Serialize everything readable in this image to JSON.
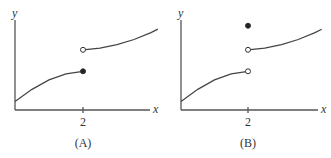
{
  "chart_data": [
    {
      "type": "line",
      "title": "",
      "caption": "(A)",
      "xlabel": "x",
      "ylabel": "y",
      "xticks": [
        {
          "value": 2,
          "label": "2"
        }
      ],
      "xlim": [
        0,
        4.4
      ],
      "ylim": [
        0,
        5
      ],
      "series": [
        {
          "name": "left-piece",
          "points": [
            [
              0,
              0.5
            ],
            [
              0.5,
              1.2
            ],
            [
              1,
              1.75
            ],
            [
              1.5,
              2.1
            ],
            [
              2,
              2.25
            ]
          ],
          "end_marker": "filled"
        },
        {
          "name": "right-piece",
          "points": [
            [
              2,
              3.5
            ],
            [
              2.5,
              3.6
            ],
            [
              3,
              3.8
            ],
            [
              3.5,
              4.1
            ],
            [
              4,
              4.5
            ],
            [
              4.2,
              4.7
            ]
          ],
          "start_marker": "open"
        }
      ],
      "extra_points": []
    },
    {
      "type": "line",
      "title": "",
      "caption": "(B)",
      "xlabel": "x",
      "ylabel": "y",
      "xticks": [
        {
          "value": 2,
          "label": "2"
        }
      ],
      "xlim": [
        0,
        4.4
      ],
      "ylim": [
        0,
        5
      ],
      "series": [
        {
          "name": "left-piece",
          "points": [
            [
              0,
              0.5
            ],
            [
              0.5,
              1.2
            ],
            [
              1,
              1.75
            ],
            [
              1.5,
              2.1
            ],
            [
              2,
              2.25
            ]
          ],
          "end_marker": "open"
        },
        {
          "name": "right-piece",
          "points": [
            [
              2,
              3.5
            ],
            [
              2.5,
              3.6
            ],
            [
              3,
              3.8
            ],
            [
              3.5,
              4.1
            ],
            [
              4,
              4.5
            ],
            [
              4.2,
              4.7
            ]
          ],
          "start_marker": "open"
        }
      ],
      "extra_points": [
        {
          "x": 2,
          "y": 4.9,
          "marker": "filled"
        }
      ]
    }
  ]
}
